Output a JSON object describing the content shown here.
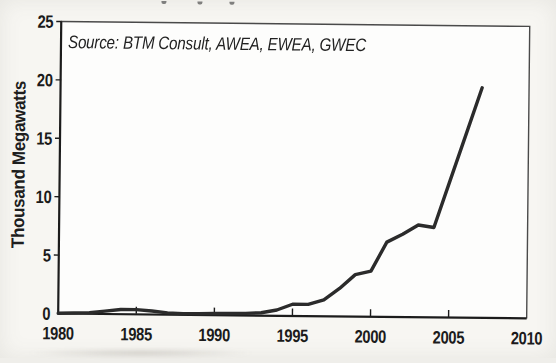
{
  "chart_data": {
    "type": "line",
    "title": "",
    "xlabel": "",
    "ylabel": "Thousand Megawatts",
    "source_note": "Source: BTM Consult, AWEA, EWEA, GWEC",
    "xlim": [
      1980,
      2010
    ],
    "ylim": [
      0,
      25
    ],
    "x_ticks": [
      "1980",
      "1985",
      "1990",
      "1995",
      "2000",
      "2005",
      "2010"
    ],
    "y_ticks": [
      "0",
      "5",
      "10",
      "15",
      "20",
      "25"
    ],
    "grid": false,
    "legend": "none",
    "framed_plot": true,
    "line_color": "#2b2b2b",
    "axis_color": "#1c1c1c",
    "frame_color": "#4a4a4a",
    "page_background": "#f7f6f2",
    "plot_background": "#fdfdfc",
    "series": [
      {
        "x": [
          1980,
          1981,
          1982,
          1983,
          1984,
          1985,
          1986,
          1987,
          1988,
          1989,
          1990,
          1991,
          1992,
          1993,
          1994,
          1995,
          1996,
          1997,
          1998,
          1999,
          2000,
          2001,
          2002,
          2003,
          2004,
          2005,
          2006,
          2007
        ],
        "y": [
          0.02,
          0.05,
          0.1,
          0.25,
          0.4,
          0.4,
          0.3,
          0.15,
          0.1,
          0.1,
          0.15,
          0.15,
          0.18,
          0.25,
          0.5,
          1.0,
          1.0,
          1.4,
          2.4,
          3.6,
          3.9,
          6.4,
          7.1,
          7.9,
          7.7,
          11.7,
          15.7,
          19.7
        ]
      }
    ]
  }
}
